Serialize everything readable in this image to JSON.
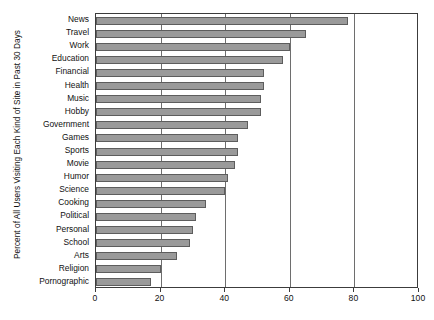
{
  "chart_data": {
    "type": "bar",
    "orientation": "horizontal",
    "title": "",
    "xlabel": "",
    "ylabel": "Percent of All Users Visiting Each Kind of Site in Past 30 Days",
    "xlim": [
      0,
      100
    ],
    "xticks": [
      0,
      20,
      40,
      60,
      80,
      100
    ],
    "xtick_labels": [
      "0",
      "20",
      "40",
      "60",
      "80",
      "100"
    ],
    "grid": true,
    "grid_axis": "x",
    "legend": null,
    "bar_color": "#9a9a9a",
    "bar_edge_color": "#5d5d5d",
    "axis_color": "#3c3c3c",
    "categories": [
      "News",
      "Travel",
      "Work",
      "Education",
      "Financial",
      "Health",
      "Music",
      "Hobby",
      "Government",
      "Games",
      "Sports",
      "Movie",
      "Humor",
      "Science",
      "Cooking",
      "Political",
      "Personal",
      "School",
      "Arts",
      "Religion",
      "Pornographic"
    ],
    "values": [
      78,
      65,
      60,
      58,
      52,
      52,
      51,
      51,
      47,
      44,
      44,
      43,
      41,
      40,
      34,
      31,
      30,
      29,
      25,
      20,
      17
    ]
  }
}
